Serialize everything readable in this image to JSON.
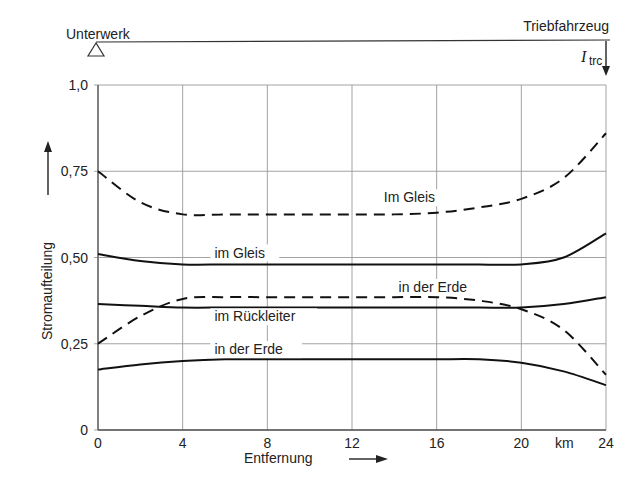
{
  "header": {
    "left_label": "Unterwerk",
    "right_label": "Triebfahrzeug",
    "current_symbol": "I",
    "current_subscript": "trc"
  },
  "chart_data": {
    "type": "line",
    "title": "",
    "xlabel": "Entfernung",
    "x_unit": "km",
    "ylabel": "Stromaufteilung",
    "xlim": [
      0,
      24
    ],
    "ylim": [
      0,
      1.0
    ],
    "x_ticks": [
      "0",
      "4",
      "8",
      "12",
      "16",
      "20",
      "24"
    ],
    "y_ticks": [
      "0",
      "0,25",
      "0,50",
      "0,75",
      "1,0"
    ],
    "grid": true,
    "x": [
      0,
      2,
      4,
      6,
      8,
      10,
      12,
      14,
      16,
      18,
      20,
      22,
      24
    ],
    "series": [
      {
        "name": "Im Gleis",
        "style": "dashed",
        "values": [
          0.75,
          0.66,
          0.625,
          0.625,
          0.625,
          0.625,
          0.625,
          0.625,
          0.63,
          0.645,
          0.67,
          0.73,
          0.86
        ]
      },
      {
        "name": "im Gleis",
        "style": "solid",
        "values": [
          0.51,
          0.49,
          0.48,
          0.48,
          0.48,
          0.48,
          0.48,
          0.48,
          0.48,
          0.48,
          0.48,
          0.5,
          0.57
        ]
      },
      {
        "name": "im Rückleiter",
        "style": "solid",
        "values": [
          0.365,
          0.36,
          0.355,
          0.355,
          0.355,
          0.355,
          0.355,
          0.355,
          0.355,
          0.355,
          0.355,
          0.365,
          0.385
        ]
      },
      {
        "name": "in der Erde",
        "style": "dashed",
        "values": [
          0.25,
          0.33,
          0.38,
          0.385,
          0.385,
          0.385,
          0.385,
          0.385,
          0.385,
          0.375,
          0.35,
          0.29,
          0.16
        ]
      },
      {
        "name": "in der Erde",
        "style": "solid",
        "values": [
          0.175,
          0.19,
          0.2,
          0.205,
          0.205,
          0.205,
          0.205,
          0.205,
          0.205,
          0.205,
          0.195,
          0.17,
          0.13
        ]
      }
    ],
    "annotations": [
      {
        "text": "Im Gleis",
        "x": 13.5,
        "y": 0.66
      },
      {
        "text": "im Gleis",
        "x": 5.5,
        "y": 0.5
      },
      {
        "text": "in der Erde",
        "x": 14.2,
        "y": 0.4
      },
      {
        "text": "im Rückleiter",
        "x": 5.5,
        "y": 0.315
      },
      {
        "text": "in der Erde",
        "x": 5.5,
        "y": 0.22
      }
    ]
  }
}
